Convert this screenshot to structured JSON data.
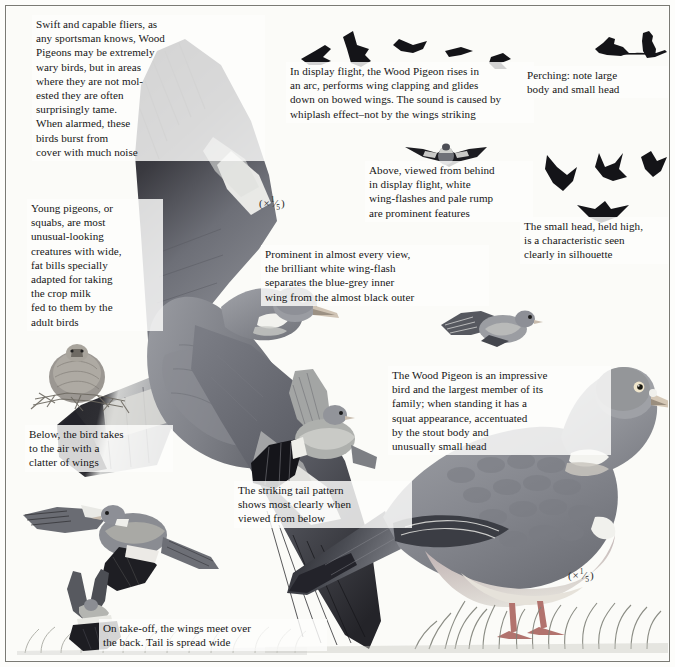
{
  "page": {
    "background_color": "#fbfbf8",
    "border_color": "#7a7a74",
    "text_color": "#161616"
  },
  "captions": {
    "top_left": "Swift and capable fliers, as\nany sportsman knows, Wood\nPigeons may be extremely\nwary birds, but in areas\nwhere they are not mol-\nested they are often\nsurprisingly tame.\nWhen alarmed, these\nbirds burst from\ncover with much noise",
    "display_flight": "In display flight, the Wood Pigeon rises in\nan arc, performs wing clapping and glides\ndown on bowed wings. The sound is caused by\nwhiplash effect–not by the wings striking",
    "perching": "Perching: note large\nbody and small head",
    "above_behind": "Above, viewed from behind\nin display flight, white\nwing-flashes and pale rump\nare prominent features",
    "small_head": "The small head, held high,\nis a characteristic seen\nclearly in silhouette",
    "young_pigeons": "Young pigeons, or\nsquabs, are most\nunusual-looking\ncreatures with wide,\nfat bills specially\nadapted for taking\nthe crop milk\nfed to them by the\nadult birds",
    "wing_flash": "Prominent in almost every view,\nthe brilliant white wing-flash\nseparates the blue-grey inner\nwing from the almost black outer",
    "takes_to_air": "Below, the bird takes\nto the air with a\nclatter of wings",
    "tail_pattern": "The striking tail pattern\nshows most clearly when\nviewed from below",
    "take_off": "On take-off, the wings meet over\nthe back. Tail is spread wide",
    "impressive_bird": "The Wood Pigeon is an impressive\nbird and the largest member of its\nfamily; when standing it has a\nsquat appearance, accentuated\nby the stout body and\nunusually small head"
  },
  "scales": {
    "flying_bird": "( × 1/5 )",
    "standing_bird": "( × 1/5 )"
  },
  "artwork": {
    "flying_pigeon_main": "wood-pigeon-in-flight-from-above",
    "standing_pigeon": "wood-pigeon-standing-in-grass",
    "squab_in_nest": "young-pigeon-squab-in-nest",
    "display_flight_silhouettes": "five-flying-pigeon-silhouettes",
    "perching_silhouettes": "two-perching-pigeon-silhouettes",
    "rear_view_flight": "pigeon-from-behind-in-display-flight",
    "flight_silhouettes_group": "four-flight-silhouettes",
    "small_flying_pigeon": "small-pigeon-in-flight",
    "bird_taking_off": "pigeon-beating-wings-on-take-off",
    "underside_flight": "pigeon-viewed-from-below-showing-tail",
    "wings_meeting": "pigeon-with-wings-meeting-over-back",
    "grass_foreground": "grass-tufts"
  },
  "palette": {
    "ink": "#161616",
    "dark_wing": "#2b2b2f",
    "mid_grey": "#6f7178",
    "body_grey": "#8d8f96",
    "pale_grey": "#c2c3c6",
    "white_flash": "#f4f4f2",
    "breast_pink": "#a79298",
    "grass": "#8f9188"
  }
}
